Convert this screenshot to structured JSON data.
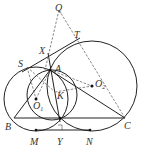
{
  "diagram": {
    "type": "geometry-figure",
    "points": [
      {
        "name": "Q",
        "x": 59,
        "y": 10,
        "lx": 55,
        "ly": 11
      },
      {
        "name": "T",
        "x": 76,
        "y": 38,
        "lx": 76,
        "ly": 38
      },
      {
        "name": "X",
        "x": 48,
        "y": 53,
        "lx": 39,
        "ly": 53
      },
      {
        "name": "S",
        "x": 27,
        "y": 67,
        "lx": 18,
        "ly": 67
      },
      {
        "name": "A",
        "x": 50,
        "y": 70,
        "lx": 55,
        "ly": 71
      },
      {
        "name": "O1",
        "x": 36,
        "y": 99,
        "lx": 33,
        "ly": 108
      },
      {
        "name": "O2",
        "x": 92,
        "y": 86,
        "lx": 96,
        "ly": 86
      },
      {
        "name": "K",
        "x": 55,
        "y": 92,
        "lx": 56,
        "ly": 98
      },
      {
        "name": "B",
        "x": 14,
        "y": 118,
        "lx": 5,
        "ly": 129
      },
      {
        "name": "C",
        "x": 125,
        "y": 118,
        "lx": 125,
        "ly": 128
      },
      {
        "name": "Y",
        "x": 60,
        "y": 130,
        "lx": 57,
        "ly": 143
      },
      {
        "name": "M",
        "x": 36,
        "y": 130,
        "lx": 31,
        "ly": 143
      },
      {
        "name": "N",
        "x": 90,
        "y": 130,
        "lx": 86,
        "ly": 143
      }
    ],
    "circles": [
      {
        "name": "circle-O1",
        "cx": 36,
        "cy": 99,
        "r": 32
      },
      {
        "name": "circle-O2",
        "cx": 92,
        "cy": 86,
        "r": 45
      },
      {
        "name": "circle-AY",
        "cx": 52,
        "cy": 95,
        "r": 25
      }
    ],
    "labels": {
      "Q": "Q",
      "T": "T",
      "X": "X",
      "S": "S",
      "A": "A",
      "O1": "O",
      "O1_sub": "1",
      "O2": "O",
      "O2_sub": "2",
      "K": "K",
      "B": "B",
      "C": "C",
      "Y": "Y",
      "M": "M",
      "N": "N"
    }
  }
}
